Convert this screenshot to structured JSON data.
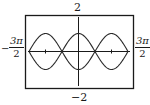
{
  "chart_data": {
    "type": "line",
    "title": "",
    "xlabel": "",
    "ylabel": "",
    "xlim": [
      -4.712,
      4.712
    ],
    "ylim": [
      -2,
      2
    ],
    "xlim_labels": {
      "min": "-3π/2",
      "max": "3π/2"
    },
    "ylim_labels": {
      "min": "-2",
      "max": "2"
    },
    "x_ticks": [
      -3.1416,
      0,
      3.1416
    ],
    "grid": false,
    "legend": null,
    "series": [
      {
        "name": "y = cos x",
        "function": "cos(x)",
        "x": [
          -4.712,
          -3.927,
          -3.1416,
          -2.356,
          -1.5708,
          -0.785,
          0,
          0.785,
          1.5708,
          2.356,
          3.1416,
          3.927,
          4.712
        ],
        "values": [
          0,
          -0.707,
          -1,
          -0.707,
          0,
          0.707,
          1,
          0.707,
          0,
          -0.707,
          -1,
          -0.707,
          0
        ]
      },
      {
        "name": "y = -cos x",
        "function": "-cos(x)",
        "x": [
          -4.712,
          -3.927,
          -3.1416,
          -2.356,
          -1.5708,
          -0.785,
          0,
          0.785,
          1.5708,
          2.356,
          3.1416,
          3.927,
          4.712
        ],
        "values": [
          0,
          0.707,
          1,
          0.707,
          0,
          -0.707,
          -1,
          -0.707,
          0,
          0.707,
          1,
          0.707,
          0
        ]
      }
    ]
  },
  "labels": {
    "ymax": "2",
    "ymin": "−2",
    "xmin_neg": "−",
    "xmin_num": "3π",
    "xmin_den": "2",
    "xmax_num": "3π",
    "xmax_den": "2"
  },
  "colors": {
    "frame": "#1a1a1a",
    "curve": "#2a2a2a",
    "axis": "#1a1a1a"
  }
}
